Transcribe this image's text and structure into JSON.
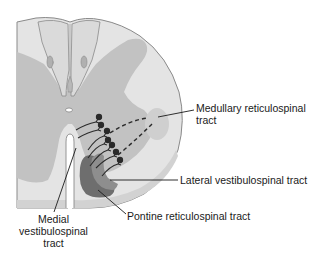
{
  "figure": {
    "colors": {
      "white_matter": "#e4e4e4",
      "gray_matter": "#c2c2c2",
      "outline": "#8a8a8a",
      "pia_edge": "#b8b8b8",
      "tract_dark": "#6e6e6e",
      "tract_mid": "#8e8e8e",
      "neuron": "#2a2a2a",
      "text": "#1a1a1a"
    }
  },
  "labels": {
    "medullary_reticulospinal": [
      "Medullary reticulospinal",
      "tract"
    ],
    "lateral_vestibulospinal": "Lateral vestibulospinal tract",
    "pontine_reticulospinal": "Pontine reticulospinal tract",
    "medial_vestibulospinal": [
      "Medial",
      "vestibulospinal",
      "tract"
    ]
  }
}
